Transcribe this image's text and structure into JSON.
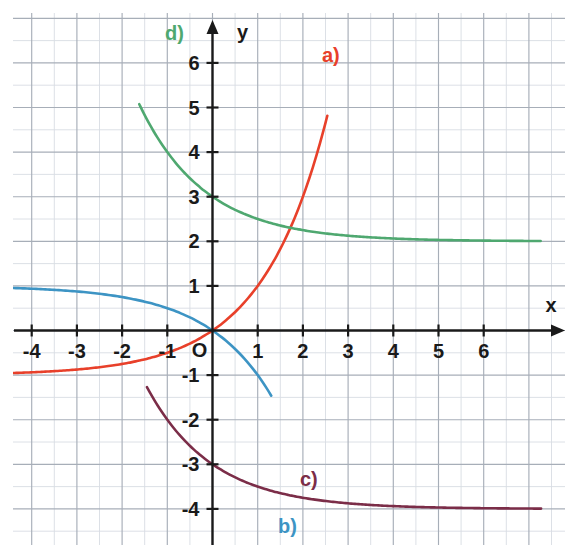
{
  "figure": {
    "background": "#ffffff"
  },
  "axes": {
    "x_label": "x",
    "y_label": "y",
    "origin_label": "O",
    "x_ticks": [
      "-4",
      "-3",
      "-2",
      "-1",
      "1",
      "2",
      "3",
      "4",
      "5",
      "6"
    ],
    "y_ticks": [
      "6",
      "5",
      "4",
      "3",
      "2",
      "1",
      "-1",
      "-2",
      "-3",
      "-4"
    ],
    "axis_color": "#1a1a1a",
    "grid_minor_color": "#d8dce3",
    "grid_major_color": "#a7aeb8"
  },
  "curve_labels": [
    {
      "id": "a",
      "text": "a)",
      "color": "#e8402a",
      "x": 322,
      "y": 44
    },
    {
      "id": "b",
      "text": "b)",
      "color": "#3d94c4",
      "x": 278,
      "y": 515
    },
    {
      "id": "c",
      "text": "c)",
      "color": "#7b2d48",
      "x": 300,
      "y": 468
    },
    {
      "id": "d",
      "text": "d)",
      "color": "#4fa870",
      "x": 165,
      "y": 22
    }
  ],
  "chart_data": {
    "type": "line",
    "xlabel": "x",
    "ylabel": "y",
    "xlim": [
      -4.7,
      7.2
    ],
    "ylim": [
      -4.9,
      7.3
    ],
    "grid": true,
    "grid_minor_step": 0.5,
    "grid_major_step": 1,
    "legend_position": "inline-curve-labels",
    "series": [
      {
        "name": "a)",
        "label": "a)",
        "color": "#e8402a",
        "formula": "y = 2^x - 1",
        "asymptote": -1,
        "y_intercept": 0,
        "x": [
          -4.7,
          -4,
          -3.5,
          -3,
          -2.5,
          -2,
          -1.5,
          -1,
          -0.5,
          0,
          0.5,
          1,
          1.5,
          2,
          2.4,
          2.6
        ],
        "y": [
          -0.962,
          -0.938,
          -0.912,
          -0.875,
          -0.823,
          -0.75,
          -0.646,
          -0.5,
          -0.293,
          0,
          0.414,
          1,
          1.828,
          3,
          5.278,
          5.9
        ]
      },
      {
        "name": "b)",
        "label": "b)",
        "color": "#3d94c4",
        "formula": "y = 1 - 2^x  (reflected exponential, asymptote y = 0 to the left)",
        "asymptote": 0,
        "y_intercept": -1,
        "x": [
          -4.7,
          -4,
          -3.5,
          -3,
          -2.5,
          -2,
          -1.5,
          -1,
          -0.5,
          0,
          0.25,
          0.5,
          0.75,
          1,
          1.2
        ],
        "y": [
          0.038,
          0.062,
          0.088,
          0.125,
          0.177,
          0.25,
          0.354,
          0.5,
          0.707,
          -1,
          -1.19,
          -1.41,
          -1.68,
          -2,
          -4.9
        ]
      },
      {
        "name": "c)",
        "label": "c)",
        "color": "#7b2d48",
        "formula": "y = 2^(-x) - 4",
        "asymptote": -4,
        "y_intercept": -3,
        "x": [
          -1.3,
          -1.2,
          -1,
          -0.8,
          -0.6,
          -0.4,
          -0.2,
          0,
          0.5,
          1,
          1.5,
          2,
          2.5,
          3,
          3.5,
          4,
          5,
          6,
          7.2
        ],
        "y": [
          7.3,
          6.0,
          4.0,
          2.8,
          1.9,
          1.2,
          0.6,
          -3.0,
          -3.29,
          -3.5,
          -3.65,
          -3.75,
          -3.82,
          -3.875,
          -3.91,
          -3.94,
          -3.97,
          -3.98,
          -3.99
        ]
      },
      {
        "name": "d)",
        "label": "d)",
        "color": "#4fa870",
        "formula": "y = 2^(-x) + 2",
        "asymptote": 2,
        "y_intercept": 3,
        "x": [
          -1.5,
          -1.3,
          -1.1,
          -0.9,
          -0.7,
          -0.5,
          -0.3,
          0,
          0.5,
          1,
          1.5,
          2,
          2.5,
          3,
          3.5,
          4,
          5,
          6,
          7.2
        ],
        "y": [
          7.3,
          6.46,
          5.14,
          4.21,
          3.52,
          3.01,
          2.63,
          3.0,
          2.71,
          2.5,
          2.35,
          2.25,
          2.18,
          2.125,
          2.09,
          2.06,
          2.03,
          2.02,
          2.01
        ]
      }
    ]
  }
}
